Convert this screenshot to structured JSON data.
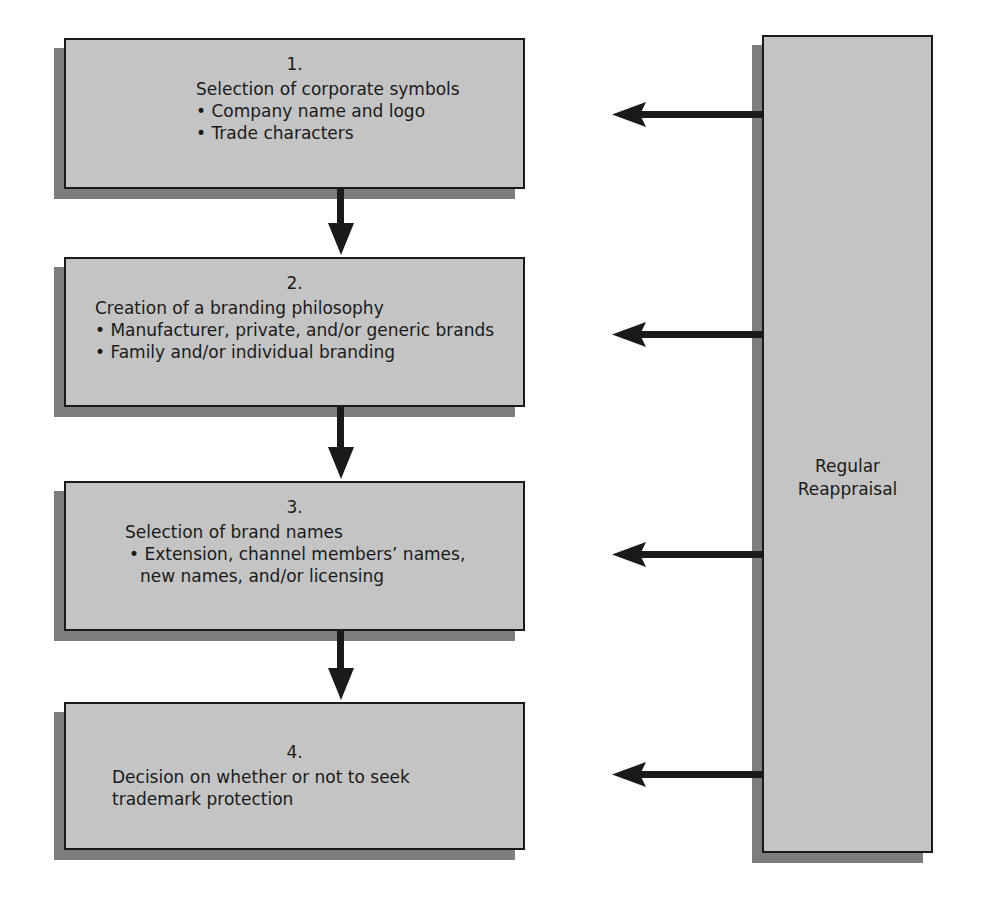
{
  "diagram": {
    "type": "flowchart",
    "steps": [
      {
        "number": "1.",
        "title": "Selection of corporate symbols",
        "bullets": [
          "• Company name and logo",
          "• Trade characters"
        ]
      },
      {
        "number": "2.",
        "title": "Creation of a branding philosophy",
        "bullets": [
          "• Manufacturer, private, and/or generic brands",
          "• Family and/or individual branding"
        ]
      },
      {
        "number": "3.",
        "title": "Selection of brand names",
        "bullets": [
          "• Extension, channel members’ names,",
          "new names, and/or licensing"
        ]
      },
      {
        "number": "4.",
        "title": "Decision on whether or not to seek",
        "bullets": [
          "trademark protection"
        ]
      }
    ],
    "feedback": {
      "label_line1": "Regular",
      "label_line2": "Reappraisal"
    },
    "colors": {
      "box_fill": "#c4c4c4",
      "shadow": "#7d7d7d",
      "border": "#1a1a1a",
      "arrow": "#1a1a1a"
    }
  }
}
